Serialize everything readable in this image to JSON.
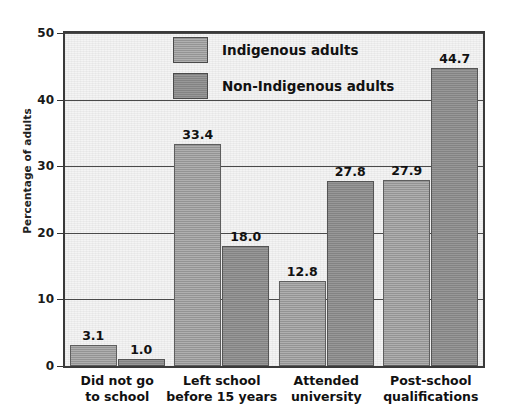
{
  "chart_data": {
    "type": "bar",
    "title": "",
    "xlabel": "",
    "ylabel": "Percentage of adults",
    "ylim": [
      0,
      50
    ],
    "yticks": [
      0,
      10,
      20,
      30,
      40,
      50
    ],
    "ytick_labels": [
      "0",
      "10",
      "20",
      "30",
      "40",
      "50"
    ],
    "grid": true,
    "legend_position": "top-center-inside",
    "categories": [
      {
        "line1": "Did not go",
        "line2": "to school"
      },
      {
        "line1": "Left school",
        "line2": "before 15 years"
      },
      {
        "line1": "Attended",
        "line2": "university"
      },
      {
        "line1": "Post-school",
        "line2": "qualifications"
      }
    ],
    "category_labels": [
      "Did not go to school",
      "Left school before 15 years",
      "Attended university",
      "Post-school qualifications"
    ],
    "series": [
      {
        "name": "Indigenous adults",
        "color": "#9a9a9a",
        "values": [
          3.1,
          33.4,
          12.8,
          27.9
        ],
        "value_labels": [
          "3.1",
          "33.4",
          "12.8",
          "27.9"
        ]
      },
      {
        "name": "Non-Indigenous adults",
        "color": "#8a8a8a",
        "values": [
          1.0,
          18.0,
          27.8,
          44.7
        ],
        "value_labels": [
          "1.0",
          "18.0",
          "27.8",
          "44.7"
        ]
      }
    ]
  },
  "colors": {
    "plot_background": "#f4f4f4",
    "axis": "#3a3a3a",
    "gridline": "#4a4a4a",
    "text": "#111111",
    "series_indigenous": "#9a9a9a",
    "series_non_indigenous": "#8a8a8a"
  }
}
